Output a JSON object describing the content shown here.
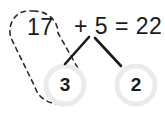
{
  "diagram": {
    "background_color": "#ffffff",
    "ink_color": "#1a1a1a",
    "ring_color": "#ebebeb",
    "equation_row": {
      "addend_a": "17",
      "rest": "+ 5 = 22"
    },
    "expression": {
      "first_addend": "17",
      "operator": "+",
      "second_addend": "5",
      "equals": "=",
      "sum": "22"
    },
    "parts": [
      {
        "id": "part-left",
        "value": "3",
        "ring_color": "#ebebeb"
      },
      {
        "id": "part-right",
        "value": "2",
        "ring_color": "#ebebeb"
      }
    ],
    "group": {
      "name": "dashed-capsule-group",
      "encloses": [
        "17",
        "3"
      ],
      "stroke_color": "#2b2b2b",
      "style": "dashed"
    },
    "connectors": [
      {
        "name": "connector-to-left-part",
        "from": "5",
        "to": "3"
      },
      {
        "name": "connector-to-right-part",
        "from": "5",
        "to": "2"
      }
    ]
  }
}
